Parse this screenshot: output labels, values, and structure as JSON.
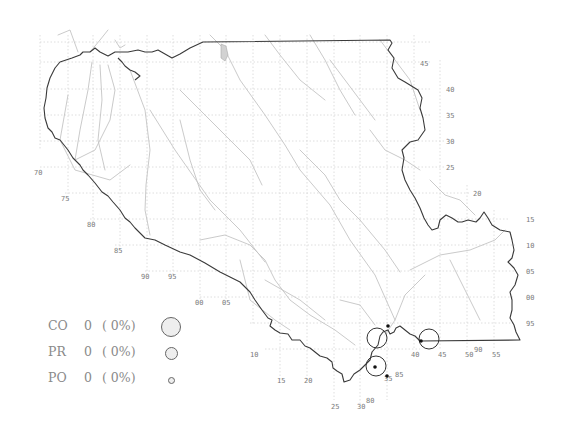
{
  "map": {
    "grid_labels": {
      "right_column": [
        "45",
        "40",
        "35",
        "30",
        "25",
        "20",
        "15",
        "10",
        "05",
        "00",
        "95"
      ],
      "left_column": [
        "70",
        "75",
        "80",
        "85",
        "90",
        "95"
      ],
      "bottom_row": [
        "00",
        "05",
        "10",
        "15",
        "20",
        "25",
        "30",
        "35",
        "40",
        "45",
        "50",
        "55"
      ],
      "misc": [
        "80",
        "85",
        "90"
      ]
    },
    "border_color": "#3a3a3a",
    "river_color": "#c4c4c4",
    "grid_color": "#d6d6d6",
    "sites": [
      {
        "type": "large-circle",
        "label": ""
      },
      {
        "type": "large-circle",
        "label": ""
      },
      {
        "type": "large-circle",
        "label": ""
      },
      {
        "type": "dot",
        "label": ""
      },
      {
        "type": "dot",
        "label": ""
      },
      {
        "type": "dot",
        "label": ""
      }
    ]
  },
  "legend": {
    "items": [
      {
        "code": "CO",
        "count": "0",
        "pct": "( 0%)",
        "symbol_size": "large"
      },
      {
        "code": "PR",
        "count": "0",
        "pct": "( 0%)",
        "symbol_size": "medium"
      },
      {
        "code": "PO",
        "count": "0",
        "pct": "( 0%)",
        "symbol_size": "small"
      }
    ]
  }
}
